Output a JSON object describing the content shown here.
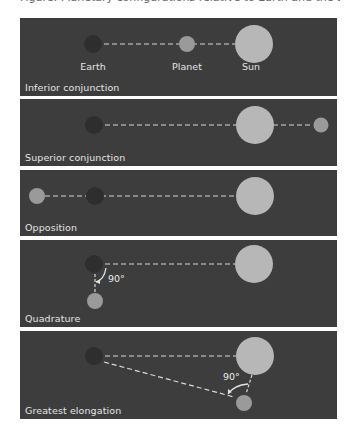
{
  "figure": {
    "caption_cutoff": "Figure: Planetary configurations relative to Earth and the Sun",
    "colors": {
      "panel_bg": "#3d3d3d",
      "earth": "#2e2e2e",
      "planet": "#9a9a9a",
      "sun": "#b7b7b7",
      "line": "#d8d8d8",
      "text": "#e4e4e4",
      "page_bg": "#ffffff"
    },
    "labels": {
      "earth": "Earth",
      "planet": "Planet",
      "sun": "Sun"
    },
    "panels": [
      {
        "id": "inferior-conjunction",
        "title": "Inferior conjunction"
      },
      {
        "id": "superior-conjunction",
        "title": "Superior conjunction"
      },
      {
        "id": "opposition",
        "title": "Opposition"
      },
      {
        "id": "quadrature",
        "title": "Quadrature",
        "angle": "90°"
      },
      {
        "id": "greatest-elongation",
        "title": "Greatest elongation",
        "angle": "90°"
      }
    ]
  }
}
